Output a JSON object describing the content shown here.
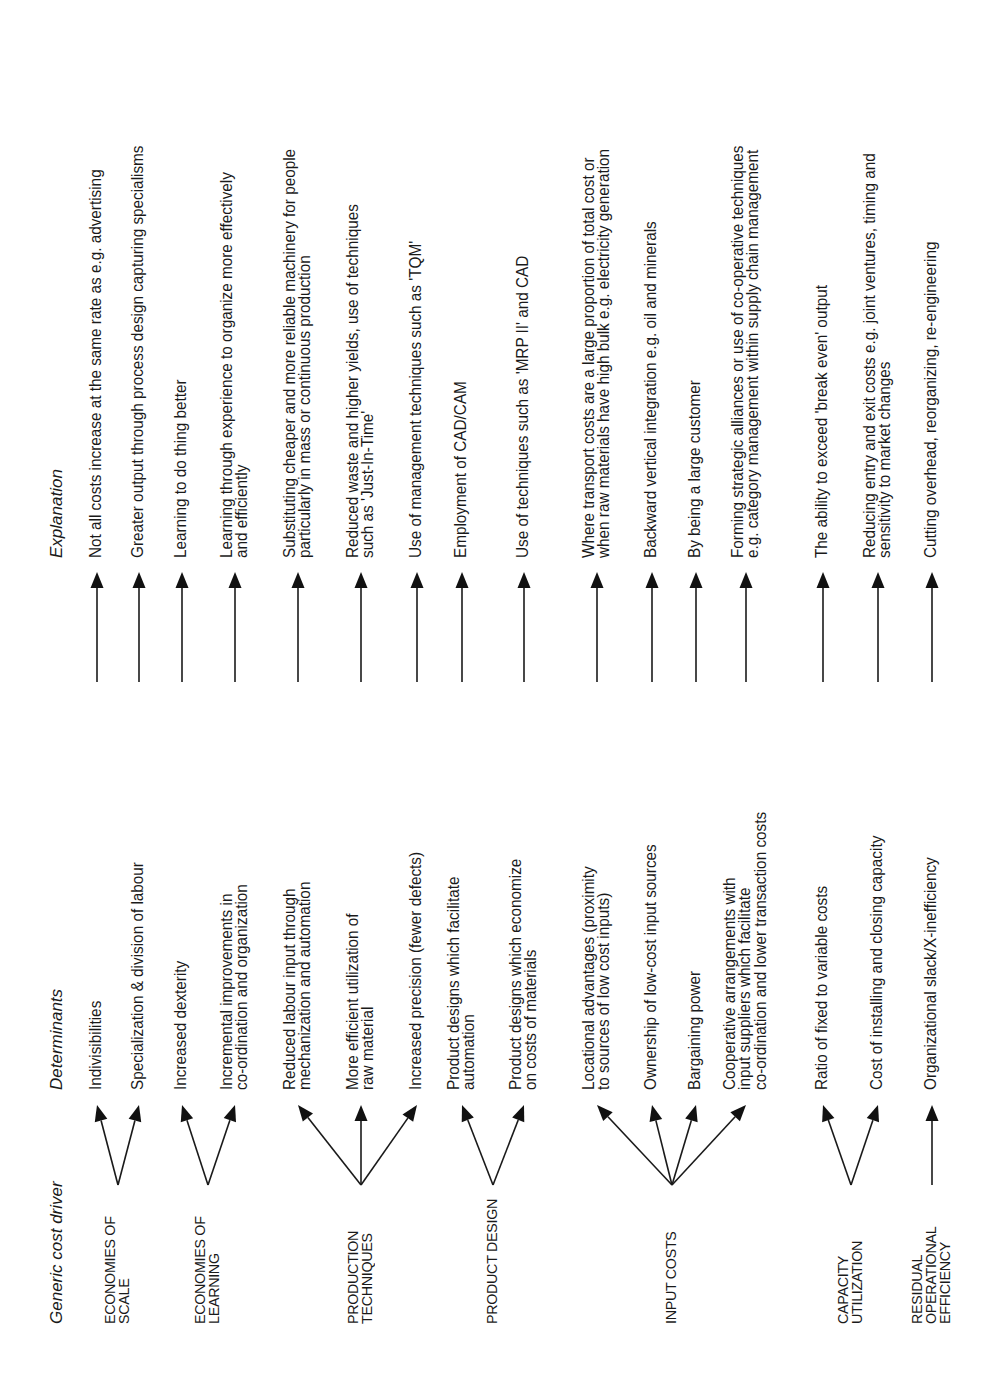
{
  "headers": {
    "driver": "Generic cost driver",
    "determinants": "Determinants",
    "explanation": "Explanation"
  },
  "drivers": [
    {
      "label": [
        "ECONOMIES OF",
        "SCALE"
      ],
      "rows": [
        {
          "determinant": [
            "Indivisibilities"
          ],
          "explanation": [
            "Not all costs increase at the same rate as e.g. advertising"
          ]
        },
        {
          "determinant": [
            "Specialization & division of labour"
          ],
          "explanation": [
            "Greater output through process design capturing specialisms"
          ]
        }
      ]
    },
    {
      "label": [
        "ECONOMIES OF",
        "LEARNING"
      ],
      "rows": [
        {
          "determinant": [
            "Increased dexterity"
          ],
          "explanation": [
            "Learning to do thing better"
          ]
        },
        {
          "determinant": [
            "Incremental improvements in",
            "co-ordination and organization"
          ],
          "explanation": [
            "Learning through experience to organize more effectively",
            "and efficiently"
          ]
        }
      ]
    },
    {
      "label": [
        "PRODUCTION",
        "TECHNIQUES"
      ],
      "rows": [
        {
          "determinant": [
            "Reduced labour input through",
            "mechanization and automation"
          ],
          "explanation": [
            "Substituting cheaper and more reliable machinery for people",
            "particularly in mass or continuous production"
          ]
        },
        {
          "determinant": [
            "More efficient utilization of",
            "raw material"
          ],
          "explanation": [
            "Reduced waste and higher yields, use of techniques",
            "such as 'Just-In-Time'"
          ]
        },
        {
          "determinant": [
            "Increased precision (fewer defects)"
          ],
          "explanation": [
            "Use of management techniques such as 'TQM'"
          ]
        }
      ]
    },
    {
      "label": [
        "PRODUCT DESIGN"
      ],
      "rows": [
        {
          "determinant": [
            "Product designs which facilitate",
            "automation"
          ],
          "explanation": [
            "Employment of CAD/CAM"
          ]
        },
        {
          "determinant": [
            "Product designs which economize",
            "on costs of materials"
          ],
          "explanation": [
            "Use of techniques such as 'MRP II' and CAD"
          ]
        }
      ]
    },
    {
      "label": [
        "INPUT COSTS"
      ],
      "rows": [
        {
          "determinant": [
            "Locational advantages (proximity",
            "to sources of low cost inputs)"
          ],
          "explanation": [
            "Where transport costs are a large proportion of total cost or",
            "when raw materials have high bulk e.g. electricity generation"
          ]
        },
        {
          "determinant": [
            "Ownership of low-cost input sources"
          ],
          "explanation": [
            "Backward vertical integration e.g. oil and minerals"
          ]
        },
        {
          "determinant": [
            "Bargaining power"
          ],
          "explanation": [
            "By being a large customer"
          ]
        },
        {
          "determinant": [
            "Cooperative arrangements with",
            "input suppliers which facilitate",
            "co-ordination and lower transaction costs"
          ],
          "explanation": [
            "Forming strategic alliances or use of co-operative techniques",
            "e.g. category management within supply chain management"
          ]
        }
      ]
    },
    {
      "label": [
        "CAPACITY",
        "UTILIZATION"
      ],
      "rows": [
        {
          "determinant": [
            "Ratio of fixed to variable costs"
          ],
          "explanation": [
            "The ability to exceed 'break even' output"
          ]
        },
        {
          "determinant": [
            "Cost of installing and closing capacity"
          ],
          "explanation": [
            "Reducing entry and exit costs e.g. joint ventures, timing and",
            "sensitivity to market changes"
          ]
        }
      ]
    },
    {
      "label": [
        "RESIDUAL",
        "OPERATIONAL",
        "EFFICIENCY"
      ],
      "rows": [
        {
          "determinant": [
            "Organizational slack/X-inefficiency"
          ],
          "explanation": [
            "Cutting overhead, reorganizing, re-engineering"
          ]
        }
      ]
    }
  ]
}
